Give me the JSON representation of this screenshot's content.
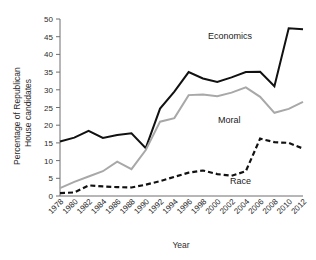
{
  "chart_data": {
    "type": "line",
    "title": "",
    "xlabel": "Year",
    "ylabel": "Percentage of Republican House candidates",
    "ylabel_line1": "Percentage of Republican",
    "ylabel_line2": "House candidates",
    "ylim": [
      0,
      50
    ],
    "yticks": [
      0,
      5,
      10,
      15,
      20,
      25,
      30,
      35,
      40,
      45,
      50
    ],
    "grid": false,
    "legend_position": "inline-annotations",
    "categories": [
      "1978",
      "1980",
      "1982",
      "1984",
      "1986",
      "1988",
      "1990",
      "1992",
      "1994",
      "1996",
      "1998",
      "2000",
      "2002",
      "2004",
      "2006",
      "2008",
      "2010",
      "2012"
    ],
    "x": [
      1978,
      1980,
      1982,
      1984,
      1986,
      1988,
      1990,
      1992,
      1994,
      1996,
      1998,
      2000,
      2002,
      2004,
      2006,
      2008,
      2010,
      2012
    ],
    "series": [
      {
        "name": "Economics",
        "color": "#111111",
        "style": "solid",
        "label": "Economics",
        "values": [
          15.4,
          16.5,
          18.4,
          16.4,
          17.2,
          17.7,
          13.5,
          24.7,
          29.5,
          35.0,
          33.2,
          32.2,
          33.5,
          35.0,
          35.1,
          31.0,
          47.4,
          47.1
        ]
      },
      {
        "name": "Moral",
        "color": "#a8a8a8",
        "style": "solid",
        "label": "Moral",
        "values": [
          2.2,
          4.0,
          5.5,
          7.0,
          9.7,
          7.6,
          13.0,
          21.0,
          22.0,
          28.5,
          28.7,
          28.2,
          29.2,
          30.7,
          28.0,
          23.5,
          24.6,
          26.6
        ]
      },
      {
        "name": "Race",
        "color": "#111111",
        "style": "dashed",
        "label": "Race",
        "values": [
          0.8,
          1.0,
          3.0,
          2.7,
          2.5,
          2.4,
          3.2,
          4.2,
          5.4,
          6.6,
          7.2,
          6.2,
          5.7,
          7.0,
          16.2,
          15.2,
          15.0,
          13.4
        ]
      }
    ]
  }
}
